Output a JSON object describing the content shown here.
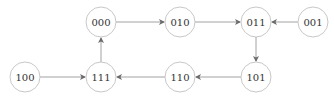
{
  "diagram": {
    "type": "state-transition-graph",
    "node_radius": 15,
    "colors": {
      "node_stroke": "#c8c8c8",
      "edge": "#8a8a8a",
      "text": "#333333",
      "background": "#ffffff"
    },
    "nodes": [
      {
        "id": "000",
        "label": "000",
        "cx": 101,
        "cy": 22
      },
      {
        "id": "010",
        "label": "010",
        "cx": 180,
        "cy": 22
      },
      {
        "id": "011",
        "label": "011",
        "cx": 256,
        "cy": 22
      },
      {
        "id": "001",
        "label": "001",
        "cx": 313,
        "cy": 22
      },
      {
        "id": "100",
        "label": "100",
        "cx": 25,
        "cy": 77
      },
      {
        "id": "111",
        "label": "111",
        "cx": 101,
        "cy": 77
      },
      {
        "id": "110",
        "label": "110",
        "cx": 180,
        "cy": 77
      },
      {
        "id": "101",
        "label": "101",
        "cx": 256,
        "cy": 77
      }
    ],
    "edges": [
      {
        "from": "000",
        "to": "010"
      },
      {
        "from": "010",
        "to": "011"
      },
      {
        "from": "001",
        "to": "011"
      },
      {
        "from": "011",
        "to": "101"
      },
      {
        "from": "101",
        "to": "110"
      },
      {
        "from": "110",
        "to": "111"
      },
      {
        "from": "100",
        "to": "111"
      },
      {
        "from": "111",
        "to": "000"
      }
    ]
  }
}
